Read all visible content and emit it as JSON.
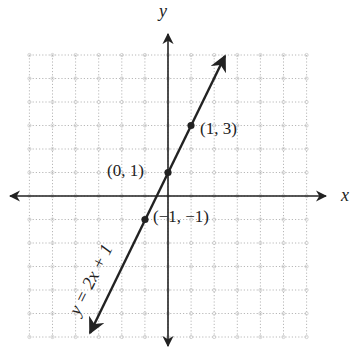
{
  "chart_data": {
    "type": "line",
    "title": "",
    "xlabel": "x",
    "ylabel": "y",
    "xlim": [
      -6,
      6
    ],
    "ylim": [
      -6,
      6
    ],
    "grid": true,
    "grid_style": "dotted",
    "axis_arrows": true,
    "series": [
      {
        "name": "y = 2x + 1",
        "equation": "y = 2x + 1",
        "slope": 2,
        "intercept": 1,
        "x": [
          -3.4,
          2.5
        ],
        "y": [
          -5.8,
          6.0
        ],
        "arrows_both_ends": true
      }
    ],
    "points": [
      {
        "x": 1,
        "y": 3,
        "label": "(1, 3)"
      },
      {
        "x": 0,
        "y": 1,
        "label": "(0, 1)"
      },
      {
        "x": -1,
        "y": -1,
        "label": "(−1, −1)"
      }
    ],
    "annotations": [
      {
        "text": "y = 2x + 1",
        "position": "along line, lower-left",
        "rotation_deg": -64
      }
    ]
  },
  "labels": {
    "x_axis": "x",
    "y_axis": "y",
    "equation": "y = 2x + 1",
    "point_1_3": "(1, 3)",
    "point_0_1": "(0, 1)",
    "point_m1_m1": "(−1, −1)"
  },
  "colors": {
    "line": "#222222",
    "axis": "#222222",
    "grid": "#b8b8b8",
    "background": "#ffffff"
  }
}
